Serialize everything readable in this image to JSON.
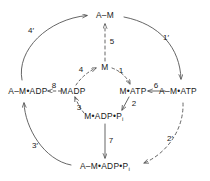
{
  "diagram": {
    "stroke_color": "#4a4a4a",
    "text_color": "#1a1a1a",
    "nodes": [
      {
        "id": "A-M",
        "text": "A–M",
        "x": 105,
        "y": 15
      },
      {
        "id": "M",
        "text": "M",
        "x": 105,
        "y": 67
      },
      {
        "id": "M-ATP",
        "text": "M•ATP",
        "x": 133,
        "y": 91
      },
      {
        "id": "A-M-ATP",
        "text": "A–M•ATP",
        "x": 178,
        "y": 91
      },
      {
        "id": "M-ADP-Pi",
        "text": "M•ADP•P",
        "sub": "i",
        "x": 104,
        "y": 116
      },
      {
        "id": "MADP",
        "text": "MADP",
        "x": 73,
        "y": 91
      },
      {
        "id": "A-M-ADP",
        "text": "A–M•ADP",
        "x": 28,
        "y": 91
      },
      {
        "id": "A-M-ADP-Pi",
        "text": "A–M•ADP•P",
        "sub": "i",
        "x": 105,
        "y": 166
      }
    ],
    "steps": [
      {
        "id": "step-1",
        "text": "1",
        "x": 121,
        "y": 71,
        "style": "dashed"
      },
      {
        "id": "step-2",
        "text": "2",
        "x": 134,
        "y": 104,
        "style": "solid"
      },
      {
        "id": "step-3",
        "text": "3",
        "x": 79,
        "y": 108,
        "style": "dashed"
      },
      {
        "id": "step-4",
        "text": "4",
        "x": 81,
        "y": 70,
        "style": "dashed"
      },
      {
        "id": "step-5",
        "text": "5",
        "x": 112,
        "y": 42,
        "style": "dashed"
      },
      {
        "id": "step-6",
        "text": "6",
        "x": 156,
        "y": 86,
        "style": "solid"
      },
      {
        "id": "step-7",
        "text": "7",
        "x": 111,
        "y": 141,
        "style": "solid"
      },
      {
        "id": "step-8",
        "text": "8",
        "x": 54,
        "y": 86,
        "style": "dashed"
      },
      {
        "id": "step-1-prime",
        "text": "1′",
        "x": 166,
        "y": 38,
        "style": "solid"
      },
      {
        "id": "step-2-prime",
        "text": "2′",
        "x": 170,
        "y": 139,
        "style": "dashed"
      },
      {
        "id": "step-3-prime",
        "text": "3′",
        "x": 35,
        "y": 146,
        "style": "solid"
      },
      {
        "id": "step-4-prime",
        "text": "4′",
        "x": 31,
        "y": 31,
        "style": "solid"
      }
    ]
  }
}
